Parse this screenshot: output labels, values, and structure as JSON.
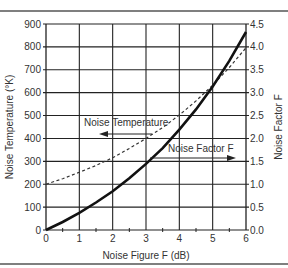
{
  "chart_data": {
    "type": "line",
    "title": "",
    "xlabel": "Noise Figure F (dB)",
    "ylabel": "Noise Temperature (°K)",
    "y2label": "Noise Factor F",
    "xlim": [
      0,
      6
    ],
    "ylim": [
      0,
      900
    ],
    "y2lim": [
      0.0,
      4.5
    ],
    "grid": true,
    "x_ticks": [
      "0",
      "1",
      "2",
      "3",
      "4",
      "5",
      "6"
    ],
    "y_ticks": [
      "0",
      "100",
      "200",
      "300",
      "400",
      "500",
      "600",
      "700",
      "800",
      "900"
    ],
    "y2_ticks": [
      "0.0",
      "0.5",
      "1.0",
      "1.5",
      "2.0",
      "2.5",
      "3.0",
      "3.5",
      "4.0",
      "4.5"
    ],
    "x": [
      0,
      0.5,
      1,
      1.5,
      2,
      2.5,
      3,
      3.5,
      4,
      4.5,
      5,
      5.5,
      6
    ],
    "series": [
      {
        "name": "Noise Temperature",
        "axis": "left",
        "style": "solid",
        "values": [
          0,
          35,
          75,
          120,
          169,
          226,
          289,
          358,
          438,
          527,
          627,
          739,
          865
        ]
      },
      {
        "name": "Noise Factor F",
        "axis": "right",
        "style": "dashed",
        "values": [
          1.0,
          1.12,
          1.26,
          1.41,
          1.58,
          1.78,
          2.0,
          2.24,
          2.51,
          2.82,
          3.16,
          3.55,
          3.98
        ]
      }
    ],
    "annotations": [
      {
        "text": "Noise Temperature",
        "arrow": "left"
      },
      {
        "text": "Noise Factor F",
        "arrow": "right"
      }
    ]
  }
}
